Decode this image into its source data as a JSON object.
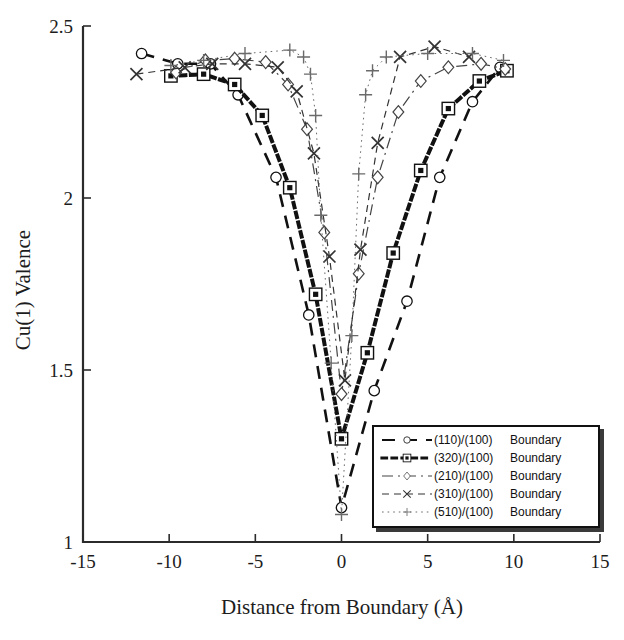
{
  "chart_data": {
    "type": "line",
    "title": "",
    "xlabel": "Distance from Boundary (Å)",
    "ylabel": "Cu(1) Valence",
    "xlim": [
      -15,
      15
    ],
    "ylim": [
      1,
      2.5
    ],
    "xticks": [
      -15,
      -10,
      -5,
      0,
      5,
      10,
      15
    ],
    "xtick_labels": [
      "-15",
      "-10",
      "-5",
      "0",
      "5",
      "10",
      "15"
    ],
    "yticks": [
      1,
      1.5,
      2,
      2.5
    ],
    "ytick_labels": [
      "1",
      "1.5",
      "2",
      "2.5"
    ],
    "grid": false,
    "legend_position": "lower-right",
    "series": [
      {
        "name": "(110)/(100)  Boundary",
        "marker": "circle",
        "linestyle": "long-dash",
        "color": "#111111",
        "linewidth": 2.6,
        "points": [
          {
            "x": -11.6,
            "y": 2.42
          },
          {
            "x": -9.5,
            "y": 2.39
          },
          {
            "x": -7.6,
            "y": 2.39
          },
          {
            "x": -6.0,
            "y": 2.3
          },
          {
            "x": -3.8,
            "y": 2.06
          },
          {
            "x": -1.9,
            "y": 1.66
          },
          {
            "x": 0.0,
            "y": 1.1
          },
          {
            "x": 1.9,
            "y": 1.44
          },
          {
            "x": 3.8,
            "y": 1.7
          },
          {
            "x": 5.7,
            "y": 2.06
          },
          {
            "x": 7.6,
            "y": 2.28
          },
          {
            "x": 9.2,
            "y": 2.38
          }
        ]
      },
      {
        "name": "(320)/(100)  Boundary",
        "marker": "square-dot",
        "linestyle": "dotted-heavy",
        "color": "#111111",
        "linewidth": 4.0,
        "points": [
          {
            "x": -9.9,
            "y": 2.355
          },
          {
            "x": -8.0,
            "y": 2.36
          },
          {
            "x": -6.2,
            "y": 2.33
          },
          {
            "x": -4.6,
            "y": 2.24
          },
          {
            "x": -3.0,
            "y": 2.03
          },
          {
            "x": -1.5,
            "y": 1.72
          },
          {
            "x": 0.0,
            "y": 1.3
          },
          {
            "x": 1.5,
            "y": 1.55
          },
          {
            "x": 3.0,
            "y": 1.84
          },
          {
            "x": 4.6,
            "y": 2.08
          },
          {
            "x": 6.2,
            "y": 2.26
          },
          {
            "x": 8.0,
            "y": 2.34
          },
          {
            "x": 9.6,
            "y": 2.37
          }
        ]
      },
      {
        "name": "(210)/(100)  Boundary",
        "marker": "diamond",
        "linestyle": "dash-dot",
        "color": "#444444",
        "linewidth": 1.2,
        "points": [
          {
            "x": -9.6,
            "y": 2.365
          },
          {
            "x": -7.9,
            "y": 2.4
          },
          {
            "x": -6.2,
            "y": 2.405
          },
          {
            "x": -4.4,
            "y": 2.395
          },
          {
            "x": -3.1,
            "y": 2.33
          },
          {
            "x": -2.0,
            "y": 2.2
          },
          {
            "x": -1.0,
            "y": 1.9
          },
          {
            "x": 0.0,
            "y": 1.43
          },
          {
            "x": 1.0,
            "y": 1.78
          },
          {
            "x": 2.1,
            "y": 2.06
          },
          {
            "x": 3.3,
            "y": 2.25
          },
          {
            "x": 4.6,
            "y": 2.34
          },
          {
            "x": 6.2,
            "y": 2.38
          },
          {
            "x": 8.1,
            "y": 2.39
          },
          {
            "x": 9.5,
            "y": 2.375
          }
        ]
      },
      {
        "name": "(310)/(100)  Boundary",
        "marker": "cross-x",
        "linestyle": "dashed",
        "color": "#333333",
        "linewidth": 1.2,
        "points": [
          {
            "x": -11.9,
            "y": 2.36
          },
          {
            "x": -9.1,
            "y": 2.38
          },
          {
            "x": -7.5,
            "y": 2.39
          },
          {
            "x": -5.6,
            "y": 2.39
          },
          {
            "x": -3.7,
            "y": 2.38
          },
          {
            "x": -2.6,
            "y": 2.31
          },
          {
            "x": -1.6,
            "y": 2.13
          },
          {
            "x": -0.7,
            "y": 1.83
          },
          {
            "x": 0.2,
            "y": 1.47
          },
          {
            "x": 1.1,
            "y": 1.85
          },
          {
            "x": 2.1,
            "y": 2.16
          },
          {
            "x": 3.4,
            "y": 2.41
          },
          {
            "x": 5.4,
            "y": 2.44
          },
          {
            "x": 7.4,
            "y": 2.41
          }
        ]
      },
      {
        "name": "(510)/(100)  Boundary",
        "marker": "plus",
        "linestyle": "dotted-light",
        "color": "#6a6a6a",
        "linewidth": 1.0,
        "points": [
          {
            "x": -9.9,
            "y": 2.385
          },
          {
            "x": -8.0,
            "y": 2.4
          },
          {
            "x": -5.6,
            "y": 2.42
          },
          {
            "x": -3.0,
            "y": 2.43
          },
          {
            "x": -2.2,
            "y": 2.41
          },
          {
            "x": -1.8,
            "y": 2.36
          },
          {
            "x": -1.5,
            "y": 2.24
          },
          {
            "x": -1.2,
            "y": 1.95
          },
          {
            "x": -0.6,
            "y": 1.52
          },
          {
            "x": 0.0,
            "y": 1.08
          },
          {
            "x": 0.6,
            "y": 1.6
          },
          {
            "x": 1.0,
            "y": 2.07
          },
          {
            "x": 1.4,
            "y": 2.3
          },
          {
            "x": 1.8,
            "y": 2.37
          },
          {
            "x": 2.6,
            "y": 2.41
          },
          {
            "x": 5.0,
            "y": 2.42
          },
          {
            "x": 7.6,
            "y": 2.42
          },
          {
            "x": 9.4,
            "y": 2.4
          }
        ]
      }
    ]
  },
  "legend": {
    "entries": [
      {
        "label": "(110)/(100)",
        "suffix": "Boundary",
        "marker": "circle",
        "style": "long-dash"
      },
      {
        "label": "(320)/(100)",
        "suffix": "Boundary",
        "marker": "square-dot",
        "style": "dotted-heavy"
      },
      {
        "label": "(210)/(100)",
        "suffix": "Boundary",
        "marker": "diamond",
        "style": "dash-dot"
      },
      {
        "label": "(310)/(100)",
        "suffix": "Boundary",
        "marker": "cross-x",
        "style": "dashed"
      },
      {
        "label": "(510)/(100)",
        "suffix": "Boundary",
        "marker": "plus",
        "style": "dotted-light"
      }
    ]
  },
  "axes": {
    "xlabel": "Distance from Boundary (Å)",
    "ylabel": "Cu(1) Valence"
  }
}
